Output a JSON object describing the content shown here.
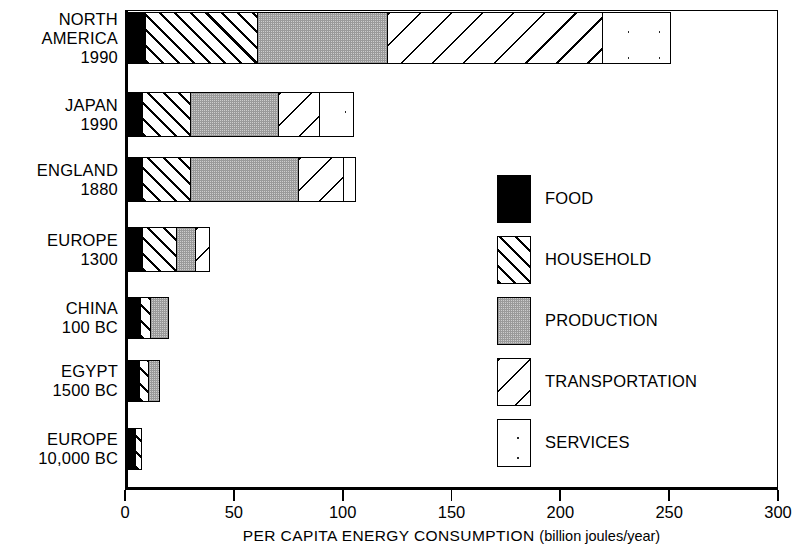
{
  "chart_data": {
    "type": "bar",
    "orientation": "horizontal",
    "stacked": true,
    "title": "",
    "xlabel": "PER CAPITA ENERGY CONSUMPTION",
    "xlabel_unit": "(billion joules/year)",
    "ylabel": "",
    "xlim": [
      0,
      300
    ],
    "xticks": [
      0,
      50,
      100,
      150,
      200,
      250,
      300
    ],
    "xtick_labels": [
      "0",
      "50",
      "100",
      "150",
      "200",
      "250",
      "300"
    ],
    "grid": false,
    "legend_position": "center-right",
    "categories": [
      "NORTH AMERICA 1990",
      "JAPAN 1990",
      "ENGLAND 1880",
      "EUROPE 1300",
      "CHINA 100 BC",
      "EGYPT 1500 BC",
      "EUROPE 10,000 BC"
    ],
    "category_labels": [
      {
        "line1": "NORTH",
        "line2": "AMERICA",
        "line3": "1990"
      },
      {
        "line1": "JAPAN",
        "line2": "1990",
        "line3": ""
      },
      {
        "line1": "ENGLAND",
        "line2": "1880",
        "line3": ""
      },
      {
        "line1": "EUROPE",
        "line2": "1300",
        "line3": ""
      },
      {
        "line1": "CHINA",
        "line2": "100 BC",
        "line3": ""
      },
      {
        "line1": "EGYPT",
        "line2": "1500 BC",
        "line3": ""
      },
      {
        "line1": "EUROPE",
        "line2": "10,000 BC",
        "line3": ""
      }
    ],
    "series": [
      {
        "name": "FOOD",
        "pattern": "solid-black",
        "values": [
          9,
          8,
          8,
          8,
          7,
          7,
          5
        ]
      },
      {
        "name": "HOUSEHOLD",
        "pattern": "dense-diagonal",
        "values": [
          52,
          22,
          22,
          16,
          5,
          4,
          3
        ]
      },
      {
        "name": "PRODUCTION",
        "pattern": "grey-stipple",
        "values": [
          60,
          41,
          50,
          9,
          8,
          5,
          0
        ]
      },
      {
        "name": "TRANSPORTATION",
        "pattern": "sparse-diagonal",
        "values": [
          99,
          19,
          21,
          6,
          0,
          0,
          0
        ]
      },
      {
        "name": "SERVICES",
        "pattern": "white-dotted",
        "values": [
          31,
          15,
          5,
          0,
          0,
          0,
          0
        ]
      }
    ],
    "totals": [
      251,
      105,
      106,
      39,
      20,
      16,
      8
    ],
    "legend_entries": [
      {
        "label": "FOOD",
        "swatch": "solid-black"
      },
      {
        "label": "HOUSEHOLD",
        "swatch": "dense-diagonal"
      },
      {
        "label": "PRODUCTION",
        "swatch": "grey-stipple"
      },
      {
        "label": "TRANSPORTATION",
        "swatch": "sparse-diagonal"
      },
      {
        "label": "SERVICES",
        "swatch": "white-dotted"
      }
    ],
    "colors": {
      "ink": "#000000",
      "background": "#ffffff",
      "production_fill": "#cdcdcd"
    }
  }
}
